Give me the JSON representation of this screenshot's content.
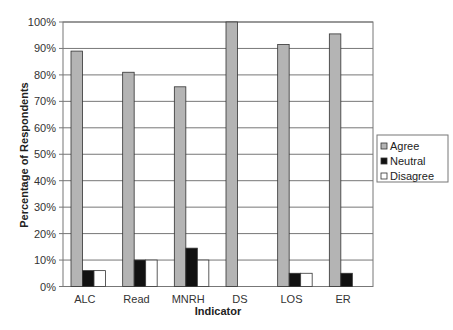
{
  "chart_data": {
    "type": "bar",
    "title": "",
    "xlabel": "Indicator",
    "ylabel": "Percentage of Respondents",
    "ylim": [
      0,
      100
    ],
    "yticks": [
      "0%",
      "10%",
      "20%",
      "30%",
      "40%",
      "50%",
      "60%",
      "70%",
      "80%",
      "90%",
      "100%"
    ],
    "grid": true,
    "legend_position": "right",
    "categories": [
      "ALC",
      "Read",
      "MNRH",
      "DS",
      "LOS",
      "ER"
    ],
    "series": [
      {
        "name": "Agree",
        "color": "#b4b4b4",
        "values": [
          89,
          81,
          75.5,
          100,
          91.5,
          95.5
        ]
      },
      {
        "name": "Neutral",
        "color": "#111111",
        "values": [
          6,
          10,
          14.5,
          0,
          5,
          5
        ]
      },
      {
        "name": "Disagree",
        "color": "#ffffff",
        "values": [
          6,
          10,
          10,
          0,
          5,
          0
        ]
      }
    ]
  }
}
